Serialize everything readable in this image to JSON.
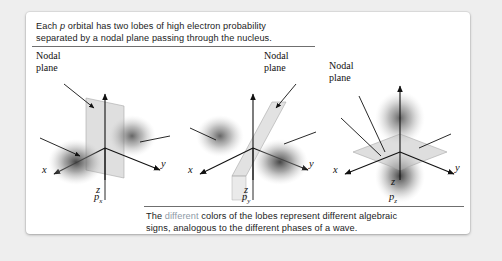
{
  "figure": {
    "top_caption": {
      "before_italic": "Each ",
      "italic": "p",
      "after_italic": " orbital has two lobes of high electron probability\nseparated by a nodal plane passing through the nucleus."
    },
    "bottom_caption": {
      "lead": "The ",
      "accent_word": "different",
      "rest": " colors of the lobes represent different algebraic\nsigns, analogous to the different phases of a wave."
    },
    "accent_color": "#8e9aa6",
    "text_color": "#1b1b1b",
    "card_background": "#ffffff",
    "page_background": "#eeeeee"
  },
  "diagrams": [
    {
      "id": "p-x",
      "orbital_label": "p",
      "orbital_subscript": "x",
      "nodal_label": "Nodal\nplane",
      "nodal_label_side": "left",
      "axes": [
        {
          "name": "z",
          "label": "z",
          "direction": "up"
        },
        {
          "name": "y",
          "label": "y",
          "direction": "lower-right"
        },
        {
          "name": "x",
          "label": "x",
          "direction": "lower-left"
        }
      ],
      "lobe_orientation": "along-x",
      "nodal_plane_orientation": "yz-plane",
      "lobe_count": 2
    },
    {
      "id": "p-y",
      "orbital_label": "p",
      "orbital_subscript": "y",
      "nodal_label": "Nodal\nplane",
      "nodal_label_side": "right",
      "axes": [
        {
          "name": "z",
          "label": "z",
          "direction": "up"
        },
        {
          "name": "y",
          "label": "y",
          "direction": "lower-right"
        },
        {
          "name": "x",
          "label": "x",
          "direction": "lower-left"
        }
      ],
      "lobe_orientation": "along-y",
      "nodal_plane_orientation": "xz-plane",
      "lobe_count": 2
    },
    {
      "id": "p-z",
      "orbital_label": "p",
      "orbital_subscript": "z",
      "nodal_label": "Nodal\nplane",
      "nodal_label_side": "left",
      "axes": [
        {
          "name": "z",
          "label": "z",
          "direction": "up"
        },
        {
          "name": "y",
          "label": "y",
          "direction": "lower-right"
        },
        {
          "name": "x",
          "label": "x",
          "direction": "lower-left"
        }
      ],
      "lobe_orientation": "along-z",
      "nodal_plane_orientation": "xy-plane",
      "lobe_count": 2
    }
  ]
}
